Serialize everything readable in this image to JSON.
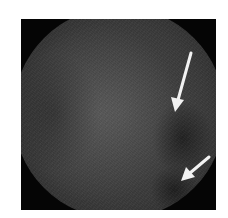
{
  "image": {
    "type": "endoscopic grayscale view",
    "frame_background": "#050505",
    "page_background": "#ffffff",
    "tissue_color": "#444444"
  },
  "annotations": [
    {
      "name": "upper-arrow",
      "color": "#f2f2f2",
      "from": [
        191,
        53
      ],
      "to": [
        175,
        112
      ]
    },
    {
      "name": "lower-arrow",
      "color": "#f2f2f2",
      "from": [
        209,
        157
      ],
      "to": [
        181,
        181
      ]
    }
  ]
}
